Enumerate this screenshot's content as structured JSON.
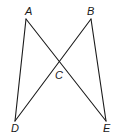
{
  "diagram": {
    "type": "geometry",
    "stroke_color": "#1a1a1a",
    "background": "#ffffff",
    "points": {
      "A": {
        "label": "A",
        "x": 26,
        "y": 19,
        "label_x": 25,
        "label_y": 15
      },
      "B": {
        "label": "B",
        "x": 91,
        "y": 19,
        "label_x": 87,
        "label_y": 15
      },
      "C": {
        "label": "C",
        "x": 59,
        "y": 61,
        "label_x": 55,
        "label_y": 79
      },
      "D": {
        "label": "D",
        "x": 15,
        "y": 121,
        "label_x": 11,
        "label_y": 132
      },
      "E": {
        "label": "E",
        "x": 106,
        "y": 121,
        "label_x": 103,
        "label_y": 132
      }
    },
    "segments": [
      {
        "from": "A",
        "to": "D"
      },
      {
        "from": "A",
        "to": "E"
      },
      {
        "from": "B",
        "to": "D"
      },
      {
        "from": "B",
        "to": "E"
      }
    ]
  }
}
